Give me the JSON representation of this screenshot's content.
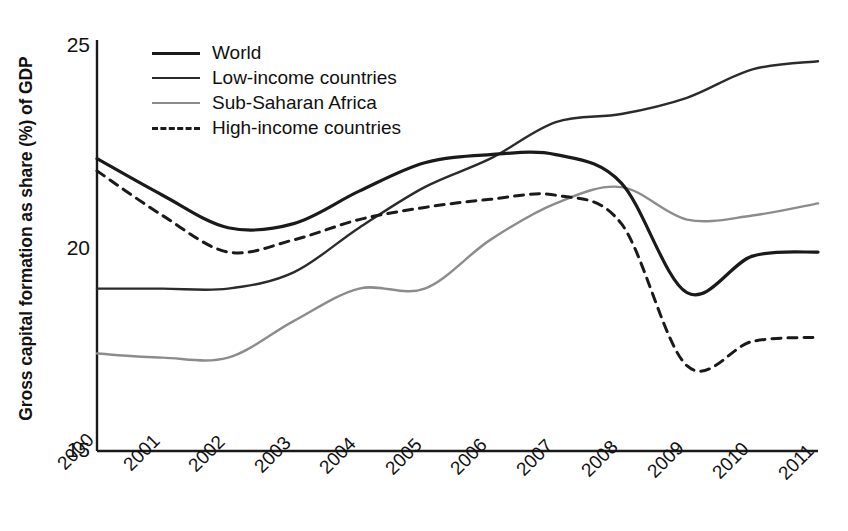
{
  "chart_data": {
    "type": "line",
    "title": "",
    "xlabel": "",
    "ylabel": "Gross capital formation as share (%) of GDP",
    "x": [
      2000,
      2001,
      2002,
      2003,
      2004,
      2005,
      2006,
      2007,
      2008,
      2009,
      2010,
      2011
    ],
    "categories": [
      "2000",
      "2001",
      "2002",
      "2003",
      "2004",
      "2005",
      "2006",
      "2007",
      "2008",
      "2009",
      "2010",
      "2011"
    ],
    "ylim": [
      15,
      25
    ],
    "xlim": [
      2000,
      2011
    ],
    "yticks": [
      15,
      20,
      25
    ],
    "ytick_labels": [
      "15",
      "20",
      "25"
    ],
    "grid": false,
    "legend_position": "top-left-inside",
    "series": [
      {
        "name": "World",
        "color": "#1a1a1a",
        "style": "solid",
        "width": 3.2,
        "values": [
          22.2,
          21.3,
          20.5,
          20.6,
          21.4,
          22.1,
          22.3,
          22.3,
          21.6,
          18.9,
          19.8,
          19.9
        ]
      },
      {
        "name": "Low-income countries",
        "color": "#2b2b2b",
        "style": "solid",
        "width": 2.4,
        "values": [
          19.0,
          19.0,
          19.0,
          19.4,
          20.5,
          21.5,
          22.2,
          23.1,
          23.3,
          23.7,
          24.4,
          24.6
        ]
      },
      {
        "name": "Sub-Saharan Africa",
        "color": "#8c8c8c",
        "style": "solid",
        "width": 2.4,
        "values": [
          17.4,
          17.3,
          17.3,
          18.2,
          19.0,
          19.0,
          20.2,
          21.1,
          21.5,
          20.7,
          20.8,
          21.1
        ]
      },
      {
        "name": "High-income countries",
        "color": "#1a1a1a",
        "style": "dashed",
        "width": 3.0,
        "values": [
          21.9,
          20.8,
          19.9,
          20.2,
          20.7,
          21.0,
          21.2,
          21.3,
          20.6,
          17.1,
          17.7,
          17.8
        ]
      }
    ]
  },
  "axis": {
    "ytick_labels": [
      "25",
      "20",
      "15"
    ],
    "xtick_labels": [
      "2000",
      "2001",
      "2002",
      "2003",
      "2004",
      "2005",
      "2006",
      "2007",
      "2008",
      "2009",
      "2010",
      "2011"
    ],
    "ylabel": "Gross capital formation as share (%) of GDP"
  },
  "legend": {
    "items": [
      {
        "label": "World",
        "swatch": "solid-black-thick-line-icon"
      },
      {
        "label": "Low-income countries",
        "swatch": "solid-dark-line-icon"
      },
      {
        "label": "Sub-Saharan Africa",
        "swatch": "solid-grey-line-icon"
      },
      {
        "label": "High-income countries",
        "swatch": "dashed-black-line-icon"
      }
    ]
  }
}
